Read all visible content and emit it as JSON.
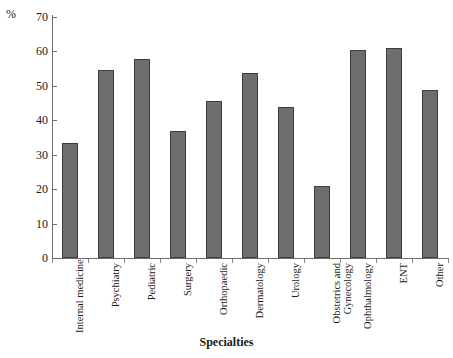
{
  "chart_data": {
    "type": "bar",
    "title": "",
    "subtitle": "",
    "xlabel": "Specialties",
    "ylabel": "%",
    "ylim": [
      0,
      70
    ],
    "yticks": [
      0,
      10,
      20,
      30,
      40,
      50,
      60,
      70
    ],
    "grid": false,
    "legend": false,
    "categories": [
      "Internal medicine",
      "Psychiatry",
      "Pediatric",
      "Surgery",
      "Orthopaedic",
      "Dermatology",
      "Urology",
      "Obstetrics and Gynecology",
      "Ophthalmology",
      "ENT",
      "Other"
    ],
    "category_lines": [
      [
        "Internal medicine"
      ],
      [
        "Psychiatry"
      ],
      [
        "Pediatric"
      ],
      [
        "Surgery"
      ],
      [
        "Orthopaedic"
      ],
      [
        "Dermatology"
      ],
      [
        "Urology"
      ],
      [
        "Obstetrics and",
        "Gynecology"
      ],
      [
        "Ophthalmology"
      ],
      [
        "ENT"
      ],
      [
        "Other"
      ]
    ],
    "values": [
      33.4,
      54.6,
      57.8,
      37.0,
      45.6,
      53.8,
      44.0,
      20.9,
      60.5,
      61.0,
      48.8
    ],
    "bar_color": "#6e6e6e",
    "bar_border_color": "#3d3d3d",
    "axis_color": "#6f6f6f"
  },
  "axis": {
    "percent_symbol": "%",
    "x_title": "Specialties"
  }
}
